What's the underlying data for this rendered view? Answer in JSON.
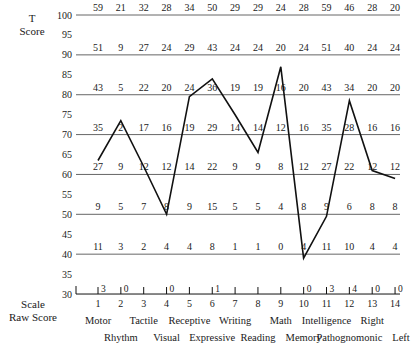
{
  "chart_data": {
    "type": "line",
    "title": "",
    "ylabel": "T Score",
    "xlabel": "Scale Raw Score",
    "ylim": [
      30,
      100
    ],
    "y_ticks": [
      100,
      95,
      90,
      85,
      80,
      75,
      70,
      65,
      60,
      55,
      50,
      45,
      40,
      35,
      30
    ],
    "grid_lines_at": [
      100,
      90,
      80,
      70,
      60,
      50,
      40
    ],
    "x": [
      1,
      2,
      3,
      4,
      5,
      6,
      7,
      8,
      9,
      10,
      11,
      12,
      13,
      14
    ],
    "scales": [
      "Motor",
      "Rhythm",
      "Tactile",
      "Visual",
      "Receptive",
      "Expressive",
      "Writing",
      "Reading",
      "Math",
      "Memory",
      "Intelligence",
      "Pathognomonic",
      "Right",
      "Left"
    ],
    "series": [
      {
        "name": "T Score profile",
        "values": [
          63.5,
          73.5,
          62,
          50,
          79.5,
          84,
          75,
          65.5,
          87,
          39,
          49.5,
          78.5,
          61,
          59
        ]
      }
    ],
    "raw_score_table": {
      "levels": [
        100,
        90,
        80,
        70,
        60,
        50,
        40
      ],
      "rows": [
        {
          "t": 100,
          "values": [
            "59",
            "21",
            "32",
            "28",
            "34",
            "50",
            "29",
            "29",
            "24",
            "28",
            "59",
            "46",
            "28",
            "20"
          ]
        },
        {
          "t": 90,
          "values": [
            "51",
            "9",
            "27",
            "24",
            "29",
            "43",
            "24",
            "24",
            "20",
            "24",
            "51",
            "40",
            "24",
            "24"
          ]
        },
        {
          "t": 80,
          "values": [
            "43",
            "5",
            "22",
            "20",
            "24",
            "36",
            "19",
            "19",
            "16",
            "20",
            "43",
            "34",
            "20",
            "20"
          ]
        },
        {
          "t": 70,
          "values": [
            "35",
            "2",
            "17",
            "16",
            "19",
            "29",
            "14",
            "14",
            "12",
            "16",
            "35",
            "28",
            "16",
            "16"
          ]
        },
        {
          "t": 60,
          "values": [
            "27",
            "9",
            "12",
            "12",
            "14",
            "22",
            "9",
            "9",
            "8",
            "12",
            "27",
            "22",
            "12",
            "12"
          ]
        },
        {
          "t": 50,
          "values": [
            "9",
            "5",
            "7",
            "8",
            "9",
            "15",
            "5",
            "5",
            "4",
            "8",
            "9",
            "6",
            "8",
            "8"
          ]
        },
        {
          "t": 40,
          "values": [
            "11",
            "3",
            "2",
            "4",
            "4",
            "8",
            "1",
            "1",
            "0",
            "4",
            "11",
            "10",
            "4",
            "4"
          ]
        },
        {
          "t": 30,
          "values": [
            "3",
            "0",
            "",
            "0",
            "",
            "1",
            "",
            "",
            "",
            "0",
            "3",
            "4",
            "0",
            "0"
          ]
        }
      ]
    }
  },
  "labels": {
    "y_axis_title_line1": "T",
    "y_axis_title_line2": "Score",
    "x_axis_title_line1": "Scale",
    "x_axis_title_line2": "Raw Score"
  },
  "colors": {
    "line": "#111111",
    "grid": "#555555",
    "text": "#1a1a1a"
  }
}
